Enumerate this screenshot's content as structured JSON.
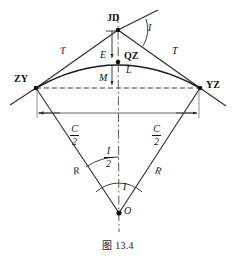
{
  "figure": {
    "caption": "图 13.4",
    "kind": "horizontal-circular-curve-survey-diagram"
  },
  "points": {
    "zy": {
      "label": "ZY",
      "x": 36,
      "y": 88
    },
    "jd": {
      "label": "JD",
      "x": 118,
      "y": 30
    },
    "yz": {
      "label": "YZ",
      "x": 200,
      "y": 88
    },
    "qz": {
      "label": "QZ",
      "x": 118,
      "y": 62
    },
    "o": {
      "label": "O",
      "x": 119,
      "y": 213
    }
  },
  "labels": {
    "tangent_left": "T",
    "tangent_right": "T",
    "external": "E",
    "mid_ordinate": "M",
    "curve_length": "L",
    "radius_left": "R",
    "radius_right": "R",
    "angle_i_top": "I",
    "angle_i_bottom": "I"
  },
  "fractions": {
    "chord_half_left": {
      "num": "C",
      "den": "2"
    },
    "chord_half_right": {
      "num": "C",
      "den": "2"
    },
    "angle_half": {
      "num": "I",
      "den": "2"
    }
  },
  "colors": {
    "ink": "#1a1a1a",
    "line": "#2a2a2a",
    "thin": "#555555",
    "dashed": "#3a3a3a",
    "background": "#ffffff"
  }
}
